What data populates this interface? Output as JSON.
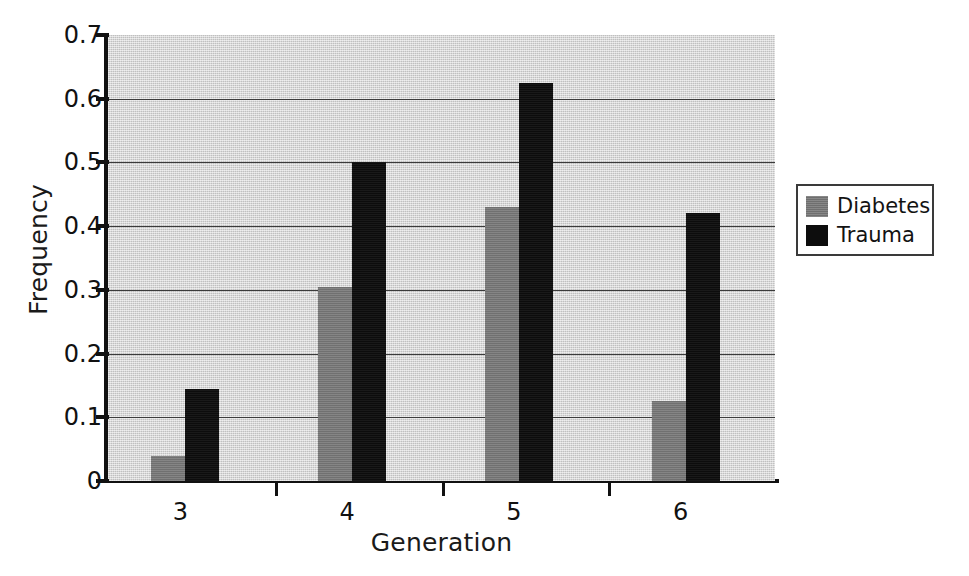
{
  "chart_data": {
    "type": "bar",
    "title": "",
    "xlabel": "Generation",
    "ylabel": "Frequency",
    "categories": [
      "3",
      "4",
      "5",
      "6"
    ],
    "series": [
      {
        "name": "Diabetes",
        "color": "#777777",
        "values": [
          0.04,
          0.305,
          0.43,
          0.125
        ]
      },
      {
        "name": "Trauma",
        "color": "#0d0d0d",
        "values": [
          0.145,
          0.5,
          0.625,
          0.42
        ]
      }
    ],
    "ylim": [
      0,
      0.7
    ],
    "yticks": [
      "0",
      "0.1",
      "0.2",
      "0.3",
      "0.4",
      "0.5",
      "0.6",
      "0.7"
    ],
    "ytick_values": [
      0,
      0.1,
      0.2,
      0.3,
      0.4,
      0.5,
      0.6,
      0.7
    ],
    "grid": true,
    "grid_axis": "y",
    "legend_position": "right-outside",
    "plot_background": "#d2d2d2",
    "grid_color": "#3b3b3b",
    "axis_color": "#111111"
  },
  "legend": {
    "entries": [
      {
        "label": "Diabetes",
        "swatch": "diabetes"
      },
      {
        "label": "Trauma",
        "swatch": "trauma"
      }
    ]
  }
}
